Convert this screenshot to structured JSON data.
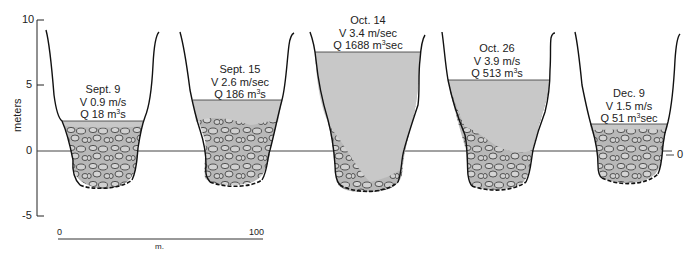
{
  "axis": {
    "ylabel": "meters",
    "ticks": [
      "10",
      "5",
      "0",
      "-5"
    ],
    "right_zero": "0"
  },
  "scale_bar": {
    "start": "0",
    "end": "100",
    "unit": "m."
  },
  "sections": [
    {
      "date": "Sept. 9",
      "velocity": "V 0.9 m/s",
      "discharge_prefix": "Q 18 m",
      "discharge_exp": "3",
      "discharge_suffix": "s",
      "water_level_m": 2.3
    },
    {
      "date": "Sept. 15",
      "velocity": "V 2.6 m/sec",
      "discharge_prefix": "Q 186 m",
      "discharge_exp": "3",
      "discharge_suffix": "s",
      "water_level_m": 3.9
    },
    {
      "date": "Oct. 14",
      "velocity": "V 3.4 m/sec",
      "discharge_prefix": "Q 1688 m",
      "discharge_exp": "3",
      "discharge_suffix": "sec",
      "water_level_m": 7.6
    },
    {
      "date": "Oct. 26",
      "velocity": "V 3.9 m/s",
      "discharge_prefix": "Q 513 m",
      "discharge_exp": "3",
      "discharge_suffix": "s",
      "water_level_m": 5.5
    },
    {
      "date": "Dec. 9",
      "velocity": "V 1.5 m/s",
      "discharge_prefix": "Q 51 m",
      "discharge_exp": "3",
      "discharge_suffix": "sec",
      "water_level_m": 2.0
    }
  ],
  "colors": {
    "water": "#c8c8c8",
    "gravel": "#b4b4b4",
    "line": "#111111"
  }
}
